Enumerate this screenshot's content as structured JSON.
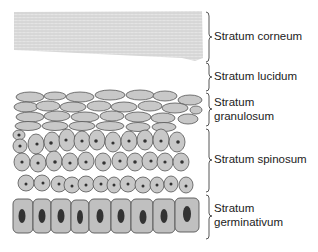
{
  "diagram": {
    "colors": {
      "cell_fill": "#c8c8c8",
      "cell_stroke": "#555555",
      "nucleus": "#333333",
      "corneum": "#d9d9d9",
      "brace": "#444444",
      "text": "#222222"
    },
    "layers": [
      {
        "id": "corneum",
        "label": "Stratum corneum",
        "brace_top": 12,
        "brace_bottom": 62
      },
      {
        "id": "lucidum",
        "label": "Stratum lucidum",
        "brace_top": 62,
        "brace_bottom": 92
      },
      {
        "id": "granulosum",
        "label_line1": "Stratum",
        "label_line2": "granulosum",
        "brace_top": 92,
        "brace_bottom": 127
      },
      {
        "id": "spinosum",
        "label": "Stratum spinosum",
        "brace_top": 128,
        "brace_bottom": 193
      },
      {
        "id": "germinativum",
        "label_line1": "Stratum",
        "label_line2": "germinativum",
        "brace_top": 194,
        "brace_bottom": 240
      }
    ]
  }
}
